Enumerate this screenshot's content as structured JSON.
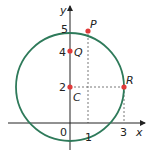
{
  "diagram": {
    "type": "coordinate-plane-circle",
    "axes": {
      "x_label": "x",
      "y_label": "y",
      "origin_label": "0",
      "x_ticks": [
        "1",
        "3"
      ],
      "y_ticks": [
        "2",
        "4",
        "5"
      ]
    },
    "circle": {
      "center": [
        0,
        2
      ],
      "radius": 3,
      "color": "#2e7a5a"
    },
    "points": [
      {
        "label": "C",
        "x": 0,
        "y": 2
      },
      {
        "label": "Q",
        "x": 0,
        "y": 4
      },
      {
        "label": "P",
        "x": 1,
        "y": 4.83
      },
      {
        "label": "R",
        "x": 3,
        "y": 2
      }
    ],
    "point_color": "#e03a3a"
  }
}
